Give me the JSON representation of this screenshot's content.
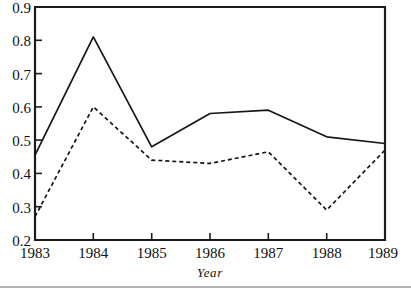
{
  "chart_data": {
    "type": "line",
    "title": "",
    "subtitle": "",
    "xlabel": "Year",
    "ylabel": "",
    "categories": [
      "1983",
      "1984",
      "1985",
      "1986",
      "1987",
      "1988",
      "1989"
    ],
    "x": [
      1983,
      1984,
      1985,
      1986,
      1987,
      1988,
      1989
    ],
    "xlim": [
      1983,
      1989
    ],
    "ylim": [
      0.2,
      0.9
    ],
    "yticks": [
      "0.2",
      "0.3",
      "0.4",
      "0.5",
      "0.6",
      "0.7",
      "0.8",
      "0.9"
    ],
    "ytick_values": [
      0.2,
      0.3,
      0.4,
      0.5,
      0.6,
      0.7,
      0.8,
      0.9
    ],
    "xticks": [
      "1983",
      "1984",
      "1985",
      "1986",
      "1987",
      "1988",
      "1989"
    ],
    "grid": false,
    "legend": null,
    "legend_position": "none",
    "series": [
      {
        "name": "solid-series",
        "style": "solid",
        "color": "#161616",
        "values": [
          0.455,
          0.81,
          0.48,
          0.58,
          0.59,
          0.51,
          0.49
        ]
      },
      {
        "name": "dashed-series",
        "style": "dashed",
        "color": "#161616",
        "values": [
          0.27,
          0.6,
          0.44,
          0.43,
          0.465,
          0.29,
          0.47
        ]
      }
    ],
    "annotations": []
  },
  "axis": {
    "x_title": "Year"
  }
}
